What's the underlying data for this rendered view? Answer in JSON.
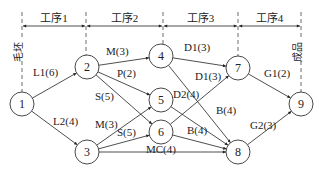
{
  "diagram": {
    "type": "process-network",
    "stages": [
      {
        "label": "工序1",
        "x1": 22,
        "x2": 86
      },
      {
        "label": "工序2",
        "x1": 86,
        "x2": 163
      },
      {
        "label": "工序3",
        "x1": 163,
        "x2": 238
      },
      {
        "label": "工序4",
        "x1": 238,
        "x2": 301
      }
    ],
    "start_label": "毛坯",
    "end_label": "成品",
    "nodes": [
      {
        "id": "1",
        "x": 22,
        "y": 104
      },
      {
        "id": "2",
        "x": 87,
        "y": 67
      },
      {
        "id": "3",
        "x": 87,
        "y": 152
      },
      {
        "id": "4",
        "x": 161,
        "y": 56
      },
      {
        "id": "5",
        "x": 161,
        "y": 100
      },
      {
        "id": "6",
        "x": 161,
        "y": 132
      },
      {
        "id": "7",
        "x": 238,
        "y": 68
      },
      {
        "id": "8",
        "x": 238,
        "y": 152
      },
      {
        "id": "9",
        "x": 301,
        "y": 104
      }
    ],
    "edges": [
      {
        "from": "1",
        "to": "2",
        "label": "L1(6)",
        "lx": 33,
        "ly": 76
      },
      {
        "from": "1",
        "to": "3",
        "label": "L2(4)",
        "lx": 53,
        "ly": 125
      },
      {
        "from": "2",
        "to": "4",
        "label": "M(3)",
        "lx": 106,
        "ly": 55
      },
      {
        "from": "2",
        "to": "5",
        "label": "P(2)",
        "lx": 117,
        "ly": 77
      },
      {
        "from": "2",
        "to": "6",
        "label": "S(5)",
        "lx": 95,
        "ly": 100
      },
      {
        "from": "3",
        "to": "5",
        "label": "M(3)",
        "lx": 95,
        "ly": 128
      },
      {
        "from": "3",
        "to": "6",
        "label": "S(5)",
        "lx": 117,
        "ly": 136
      },
      {
        "from": "3",
        "to": "8",
        "label": "MC(4)",
        "lx": 146,
        "ly": 153
      },
      {
        "from": "4",
        "to": "7",
        "label": "D1(3)",
        "lx": 184,
        "ly": 51
      },
      {
        "from": "4",
        "to": "8",
        "label": "B(4)",
        "lx": 216,
        "ly": 114
      },
      {
        "from": "5",
        "to": "8",
        "label": "D2(4)",
        "lx": 173,
        "ly": 98
      },
      {
        "from": "6",
        "to": "7",
        "label": "D1(3)",
        "lx": 195,
        "ly": 80
      },
      {
        "from": "6",
        "to": "8",
        "label": "B(4)",
        "lx": 187,
        "ly": 134
      },
      {
        "from": "7",
        "to": "9",
        "label": "G1(2)",
        "lx": 264,
        "ly": 77
      },
      {
        "from": "8",
        "to": "9",
        "label": "G2(3)",
        "lx": 250,
        "ly": 129
      }
    ]
  }
}
